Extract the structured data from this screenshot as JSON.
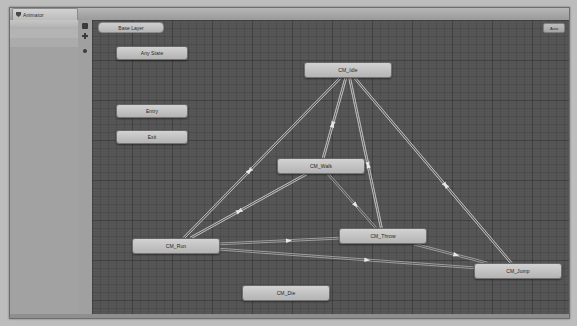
{
  "window": {
    "tab_label": "Animator",
    "tab_icon": "animator-icon",
    "breadcrumb_label": "Base Layer",
    "auto_button_label": "Auto"
  },
  "left_panel": {
    "icons": [
      {
        "name": "layers-icon",
        "glyph": "sq"
      },
      {
        "name": "add-layer-icon",
        "glyph": "plus"
      },
      {
        "name": "layer-settings-icon",
        "glyph": "dot"
      }
    ]
  },
  "graph": {
    "nodes": [
      {
        "id": "any_state",
        "label": "Any State",
        "x": 24,
        "y": 26,
        "w": 72,
        "h": 14
      },
      {
        "id": "entry",
        "label": "Entry",
        "x": 24,
        "y": 84,
        "w": 72,
        "h": 14
      },
      {
        "id": "exit",
        "label": "Exit",
        "x": 24,
        "y": 110,
        "w": 72,
        "h": 14
      },
      {
        "id": "cm_idle",
        "label": "CM_Idle",
        "x": 212,
        "y": 42,
        "w": 88,
        "h": 16
      },
      {
        "id": "cm_walk",
        "label": "CM_Walk",
        "x": 185,
        "y": 138,
        "w": 88,
        "h": 16
      },
      {
        "id": "cm_throw",
        "label": "CM_Throw",
        "x": 247,
        "y": 208,
        "w": 88,
        "h": 16
      },
      {
        "id": "cm_run",
        "label": "CM_Run",
        "x": 40,
        "y": 218,
        "w": 88,
        "h": 16
      },
      {
        "id": "cm_jump",
        "label": "CM_Jump",
        "x": 382,
        "y": 243,
        "w": 88,
        "h": 16
      },
      {
        "id": "cm_die",
        "label": "CM_Die",
        "x": 150,
        "y": 265,
        "w": 88,
        "h": 16
      }
    ],
    "transitions": [
      {
        "from": "cm_idle",
        "to": "cm_walk"
      },
      {
        "from": "cm_walk",
        "to": "cm_idle"
      },
      {
        "from": "cm_idle",
        "to": "cm_run"
      },
      {
        "from": "cm_run",
        "to": "cm_idle"
      },
      {
        "from": "cm_idle",
        "to": "cm_throw"
      },
      {
        "from": "cm_throw",
        "to": "cm_idle"
      },
      {
        "from": "cm_idle",
        "to": "cm_jump"
      },
      {
        "from": "cm_jump",
        "to": "cm_idle"
      },
      {
        "from": "cm_walk",
        "to": "cm_run"
      },
      {
        "from": "cm_run",
        "to": "cm_walk"
      },
      {
        "from": "cm_walk",
        "to": "cm_throw"
      },
      {
        "from": "cm_run",
        "to": "cm_throw"
      },
      {
        "from": "cm_run",
        "to": "cm_jump"
      },
      {
        "from": "cm_throw",
        "to": "cm_jump"
      }
    ],
    "colors": {
      "canvas_background": "#555555",
      "node_fill": "#c4c4c4",
      "transition_line": "#cfcfcf"
    }
  }
}
